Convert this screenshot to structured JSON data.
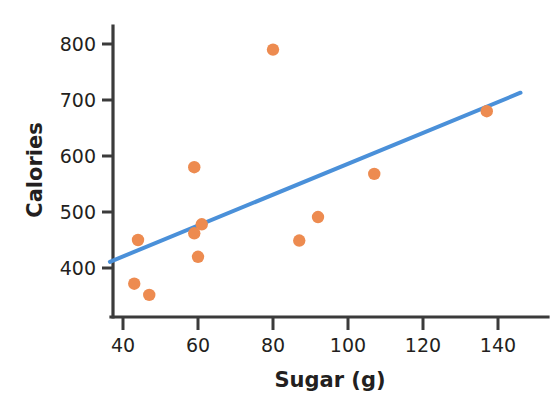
{
  "chart_data": {
    "type": "scatter",
    "title": "",
    "xlabel": "Sugar (g)",
    "ylabel": "Calories",
    "xlim": [
      36,
      146
    ],
    "ylim": [
      330,
      830
    ],
    "xticks": [
      40,
      60,
      80,
      100,
      120,
      140
    ],
    "yticks": [
      400,
      500,
      600,
      700,
      800
    ],
    "xtick_labels": [
      "40",
      "60",
      "80",
      "100",
      "120",
      "140"
    ],
    "ytick_labels": [
      "400",
      "500",
      "600",
      "700",
      "800"
    ],
    "grid": false,
    "legend": null,
    "point_color": "#ed8b50",
    "line_color": "#4a90d9",
    "axis_color": "#3b3b3b",
    "points": [
      {
        "x": 44,
        "y": 450
      },
      {
        "x": 43,
        "y": 372
      },
      {
        "x": 47,
        "y": 352
      },
      {
        "x": 59,
        "y": 580
      },
      {
        "x": 59,
        "y": 462
      },
      {
        "x": 61,
        "y": 478
      },
      {
        "x": 60,
        "y": 420
      },
      {
        "x": 80,
        "y": 790
      },
      {
        "x": 87,
        "y": 449
      },
      {
        "x": 92,
        "y": 491
      },
      {
        "x": 107,
        "y": 568
      },
      {
        "x": 137,
        "y": 680
      }
    ],
    "trendline": {
      "name": "line of best fit",
      "x_start": 36.5,
      "y_start": 411,
      "x_end": 146,
      "y_end": 713
    }
  },
  "axes": {
    "x_title": "Sugar (g)",
    "y_title": "Calories"
  }
}
